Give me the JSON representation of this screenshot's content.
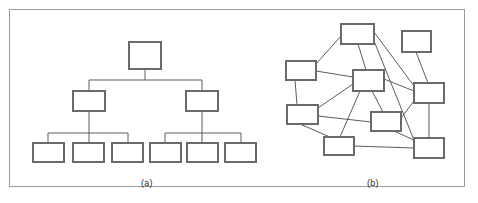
{
  "figure": {
    "frame": {
      "border_color": "#9a9a9a",
      "background": "#ffffff"
    },
    "node_stroke_color": "#6a6a6a",
    "edge_stroke_color": "#5d5d5d",
    "panels": [
      {
        "id": "panel-a",
        "caption": "(a)",
        "topology": "hierarchical-tree",
        "node_count": 9,
        "edge_count": 8
      },
      {
        "id": "panel-b",
        "caption": "(b)",
        "topology": "mesh-network",
        "node_count": 9,
        "edge_count": 17
      }
    ]
  },
  "chart_data": {
    "type": "diagram",
    "title": "",
    "subtitle": "",
    "diagrams": [
      {
        "label": "(a)",
        "kind": "tree",
        "levels": 3,
        "nodes": [
          {
            "id": "a1",
            "level": 0,
            "x": 129,
            "y": 42,
            "w": 32,
            "h": 27
          },
          {
            "id": "a2",
            "level": 1,
            "x": 73,
            "y": 91,
            "w": 32,
            "h": 20
          },
          {
            "id": "a3",
            "level": 1,
            "x": 186,
            "y": 91,
            "w": 32,
            "h": 20
          },
          {
            "id": "a4",
            "level": 2,
            "x": 33,
            "y": 143,
            "w": 31,
            "h": 19
          },
          {
            "id": "a5",
            "level": 2,
            "x": 73,
            "y": 143,
            "w": 31,
            "h": 19
          },
          {
            "id": "a6",
            "level": 2,
            "x": 112,
            "y": 143,
            "w": 31,
            "h": 19
          },
          {
            "id": "a7",
            "level": 2,
            "x": 150,
            "y": 143,
            "w": 31,
            "h": 19
          },
          {
            "id": "a8",
            "level": 2,
            "x": 187,
            "y": 143,
            "w": 31,
            "h": 19
          },
          {
            "id": "a9",
            "level": 2,
            "x": 225,
            "y": 143,
            "w": 31,
            "h": 19
          }
        ],
        "edges": [
          [
            "a1",
            "a2"
          ],
          [
            "a1",
            "a3"
          ],
          [
            "a2",
            "a4"
          ],
          [
            "a2",
            "a5"
          ],
          [
            "a2",
            "a6"
          ],
          [
            "a3",
            "a7"
          ],
          [
            "a3",
            "a8"
          ],
          [
            "a3",
            "a9"
          ]
        ]
      },
      {
        "label": "(b)",
        "kind": "mesh",
        "nodes": [
          {
            "id": "b1",
            "x": 341,
            "y": 24,
            "w": 33,
            "h": 20
          },
          {
            "id": "b2",
            "x": 402,
            "y": 31,
            "w": 29,
            "h": 21
          },
          {
            "id": "b3",
            "x": 286,
            "y": 61,
            "w": 30,
            "h": 19
          },
          {
            "id": "b4",
            "x": 287,
            "y": 105,
            "w": 31,
            "h": 19
          },
          {
            "id": "b5",
            "x": 353,
            "y": 70,
            "w": 31,
            "h": 21
          },
          {
            "id": "b6",
            "x": 414,
            "y": 83,
            "w": 30,
            "h": 20
          },
          {
            "id": "b7",
            "x": 324,
            "y": 137,
            "w": 30,
            "h": 18
          },
          {
            "id": "b8",
            "x": 371,
            "y": 112,
            "w": 30,
            "h": 19
          },
          {
            "id": "b9",
            "x": 414,
            "y": 138,
            "w": 30,
            "h": 20
          }
        ],
        "edges": [
          [
            "b1",
            "b3"
          ],
          [
            "b1",
            "b5"
          ],
          [
            "b1",
            "b6"
          ],
          [
            "b1",
            "b9"
          ],
          [
            "b2",
            "b6"
          ],
          [
            "b3",
            "b5"
          ],
          [
            "b3",
            "b4"
          ],
          [
            "b4",
            "b5"
          ],
          [
            "b4",
            "b7"
          ],
          [
            "b4",
            "b8"
          ],
          [
            "b5",
            "b6"
          ],
          [
            "b5",
            "b7"
          ],
          [
            "b5",
            "b8"
          ],
          [
            "b6",
            "b8"
          ],
          [
            "b6",
            "b9"
          ],
          [
            "b7",
            "b9"
          ],
          [
            "b8",
            "b9"
          ]
        ]
      }
    ]
  }
}
